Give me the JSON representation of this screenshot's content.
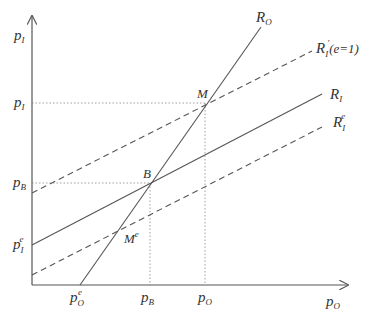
{
  "diagram": {
    "axes": {
      "y_label": {
        "base": "p",
        "sub": "I"
      },
      "x_label": {
        "base": "p",
        "sub": "O"
      }
    },
    "y_ticks": [
      {
        "base": "p",
        "sub": "I",
        "sup": ""
      },
      {
        "base": "p",
        "sub": "B",
        "sup": ""
      },
      {
        "base": "p",
        "sub": "I",
        "sup": "e"
      }
    ],
    "x_ticks": [
      {
        "base": "p",
        "sub": "O",
        "sup": "e"
      },
      {
        "base": "p",
        "sub": "B",
        "sup": ""
      },
      {
        "base": "p",
        "sub": "O",
        "sup": ""
      }
    ],
    "curves": [
      {
        "name": "R_O",
        "base": "R",
        "sub": "O",
        "sup": "",
        "suffix": "",
        "style": "solid"
      },
      {
        "name": "R_I_prime",
        "base": "R",
        "sub": "I",
        "sup": "′",
        "suffix": "(e=1)",
        "style": "dashed"
      },
      {
        "name": "R_I",
        "base": "R",
        "sub": "I",
        "sup": "",
        "suffix": "",
        "style": "solid"
      },
      {
        "name": "R_I_e",
        "base": "R",
        "sub": "I",
        "sup": "e",
        "suffix": "",
        "style": "dashed"
      }
    ],
    "points": [
      {
        "name": "M",
        "base": "M",
        "sup": ""
      },
      {
        "name": "B",
        "base": "B",
        "sup": ""
      },
      {
        "name": "M_e",
        "base": "M",
        "sup": "e"
      }
    ],
    "colors": {
      "line": "#555555",
      "text": "#333333",
      "guide": "#888888"
    }
  }
}
